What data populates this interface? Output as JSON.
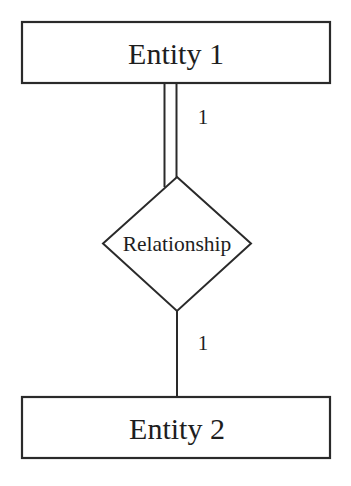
{
  "diagram": {
    "type": "ER diagram",
    "entities": [
      {
        "label": "Entity 1"
      },
      {
        "label": "Entity 2"
      }
    ],
    "relationship": {
      "label": "Relationship"
    },
    "connections": [
      {
        "from": "Entity 1",
        "to": "Relationship",
        "cardinality": "1",
        "participation": "total (double line)"
      },
      {
        "from": "Relationship",
        "to": "Entity 2",
        "cardinality": "1",
        "participation": "partial (single line)"
      }
    ],
    "colors": {
      "stroke": "#2a2a2a",
      "text": "#1e1e1e",
      "background": "#ffffff"
    }
  }
}
